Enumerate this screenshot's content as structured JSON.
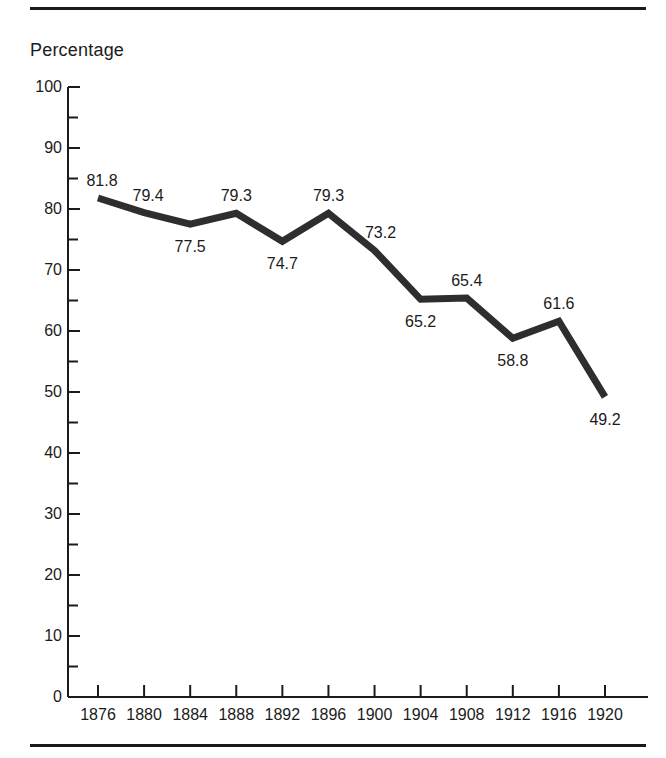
{
  "figure": {
    "axis_title": "Percentage",
    "rule_color": "#1a1a1a",
    "line_color": "#2e2e2e"
  },
  "chart_data": {
    "type": "line",
    "title": "",
    "subtitle": "",
    "xlabel": "",
    "ylabel": "Percentage",
    "categories": [
      "1876",
      "1880",
      "1884",
      "1888",
      "1892",
      "1896",
      "1900",
      "1904",
      "1908",
      "1912",
      "1916",
      "1920"
    ],
    "x": [
      1876,
      1880,
      1884,
      1888,
      1892,
      1896,
      1900,
      1904,
      1908,
      1912,
      1916,
      1920
    ],
    "values": [
      81.8,
      79.4,
      77.5,
      79.3,
      74.7,
      79.3,
      73.2,
      65.2,
      65.4,
      58.8,
      61.6,
      49.2
    ],
    "point_labels": [
      "81.8",
      "79.4",
      "77.5",
      "79.3",
      "74.7",
      "79.3",
      "73.2",
      "65.2",
      "65.4",
      "58.8",
      "61.6",
      "49.2"
    ],
    "label_positions": [
      "above",
      "above",
      "below",
      "above",
      "below",
      "above",
      "above",
      "below",
      "above",
      "below",
      "above",
      "below"
    ],
    "ylim": [
      0,
      100
    ],
    "xlim": [
      1876,
      1920
    ],
    "ytick_labels": [
      "0",
      "10",
      "20",
      "30",
      "40",
      "50",
      "60",
      "70",
      "80",
      "90",
      "100"
    ],
    "yticks": [
      0,
      10,
      20,
      30,
      40,
      50,
      60,
      70,
      80,
      90,
      100
    ],
    "yminor_ticks": [
      5,
      15,
      25,
      35,
      45,
      55,
      65,
      75,
      85,
      95
    ],
    "xtick_labels": [
      "1876",
      "1880",
      "1884",
      "1888",
      "1892",
      "1896",
      "1900",
      "1904",
      "1908",
      "1912",
      "1916",
      "1920"
    ],
    "grid": false,
    "legend": null,
    "legend_position": "none",
    "annotations": []
  }
}
